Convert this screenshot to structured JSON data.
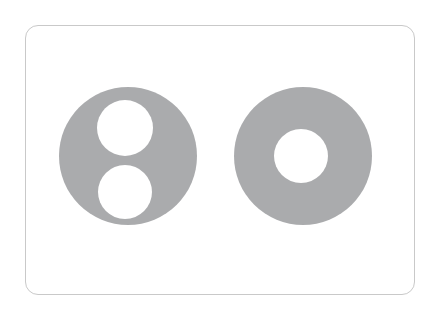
{
  "canvas": {
    "width": 437,
    "height": 314,
    "background_color": "#ffffff"
  },
  "card": {
    "name": "shape-comparison-card",
    "x": 25,
    "y": 25,
    "width": 390,
    "height": 270,
    "fill_color": "#ffffff",
    "border_color": "#c9c9c9",
    "border_width": 1,
    "corner_radius": 13
  },
  "palette": {
    "shape_gray": "#aaabad",
    "hole_white": "#ffffff",
    "card_border": "#c9c9c9",
    "page_background": "#ffffff"
  },
  "figures": [
    {
      "name": "two-hole-disc",
      "description": "Gray disc with two stacked circular holes",
      "fill_color": "#aaabad",
      "outer_circle": {
        "cx": 128,
        "cy": 156,
        "r": 69
      },
      "holes": [
        {
          "name": "upper-hole",
          "cx": 125,
          "cy": 128,
          "r": 28
        },
        {
          "name": "lower-hole",
          "cx": 125,
          "cy": 192,
          "r": 27
        }
      ],
      "hole_count": 2
    },
    {
      "name": "annulus-disc",
      "description": "Gray disc with one central circular hole",
      "fill_color": "#aaabad",
      "outer_circle": {
        "cx": 303,
        "cy": 156,
        "r": 69
      },
      "holes": [
        {
          "name": "center-hole",
          "cx": 301,
          "cy": 156,
          "r": 27
        }
      ],
      "hole_count": 1
    }
  ]
}
